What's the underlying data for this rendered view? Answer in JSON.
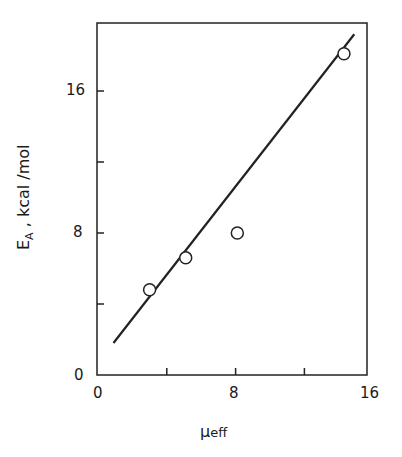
{
  "chart_data": {
    "type": "scatter",
    "title": "",
    "xlabel": "μeff",
    "ylabel": "E_A , kcal/mol",
    "xlim": [
      0,
      16
    ],
    "ylim": [
      0,
      20
    ],
    "x_ticks": [
      0,
      4,
      8,
      12,
      16
    ],
    "x_tick_labels": [
      "0",
      "",
      "8",
      "",
      "16"
    ],
    "y_ticks": [
      0,
      4,
      8,
      12,
      16
    ],
    "y_tick_labels": [
      "0",
      "",
      "8",
      "",
      "16"
    ],
    "grid": false,
    "legend": null,
    "series": [
      {
        "name": "data",
        "marker": "open-circle",
        "points": [
          {
            "x": 3.0,
            "y": 4.8
          },
          {
            "x": 5.1,
            "y": 6.6
          },
          {
            "x": 8.1,
            "y": 8.0
          },
          {
            "x": 14.3,
            "y": 18.1
          }
        ]
      },
      {
        "name": "fit",
        "type": "line",
        "points": [
          {
            "x": 0.9,
            "y": 1.8
          },
          {
            "x": 14.9,
            "y": 19.2
          }
        ]
      }
    ]
  },
  "labels": {
    "y_main": "E",
    "y_sub": "A",
    "y_unit": " ,  kcal /mol",
    "x_main": "μ",
    "x_sub": "eff",
    "xt0": "0",
    "xt8": "8",
    "xt16": "16",
    "yt0": "0",
    "yt8": "8",
    "yt16": "16"
  }
}
